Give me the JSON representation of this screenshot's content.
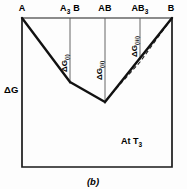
{
  "figure": {
    "caption": "(b)",
    "temperature_note": "At T",
    "temperature_sub": "3",
    "y_axis_label": "ΔG",
    "frame_color": "#1a1a1a",
    "curve_color": "#111111",
    "gridline_color": "#555555",
    "dashed_color": "#222222",
    "background_color": "#fdfdfd"
  },
  "top_labels": [
    {
      "main": "A",
      "sub": ""
    },
    {
      "main": "A",
      "sub": "3",
      "tail": "B"
    },
    {
      "main": "AB",
      "sub": ""
    },
    {
      "main": "AB",
      "sub": "3"
    },
    {
      "main": "B",
      "sub": ""
    }
  ],
  "delta_labels": [
    {
      "main": "ΔG",
      "sub": "(i)"
    },
    {
      "main": "ΔG",
      "sub": "(ii)"
    },
    {
      "main": "ΔG",
      "sub": "(iii)"
    }
  ],
  "chart_data": {
    "type": "line",
    "title": "",
    "subtitle": "At T3",
    "xlabel": "",
    "ylabel": "ΔG",
    "grid": false,
    "legend": "none",
    "x_categories": [
      "A",
      "A3B",
      "AB",
      "AB3",
      "B"
    ],
    "x_positions": [
      22,
      70,
      105,
      140,
      172
    ],
    "axis_frame": {
      "left": 22,
      "right": 172,
      "top": 18,
      "bottom": 167
    },
    "gridlines_x": [
      70,
      105,
      140
    ],
    "series": [
      {
        "name": "free-energy-curve-solid",
        "style": "solid",
        "points": [
          {
            "x": 22,
            "y": 18
          },
          {
            "x": 70,
            "y": 82
          },
          {
            "x": 105,
            "y": 102
          },
          {
            "x": 172,
            "y": 18
          }
        ]
      },
      {
        "name": "free-energy-curve-dashed",
        "style": "dashed",
        "points": [
          {
            "x": 107,
            "y": 99
          },
          {
            "x": 140,
            "y": 62
          },
          {
            "x": 172,
            "y": 18
          }
        ]
      }
    ],
    "annotations": [
      {
        "text": "ΔG(i)",
        "x": 70,
        "orientation": "vertical"
      },
      {
        "text": "ΔG(ii)",
        "x": 105,
        "orientation": "vertical"
      },
      {
        "text": "ΔG(iii)",
        "x": 140,
        "orientation": "vertical"
      },
      {
        "text": "At T3",
        "x": 140,
        "y": 140,
        "orientation": "horizontal"
      }
    ]
  }
}
